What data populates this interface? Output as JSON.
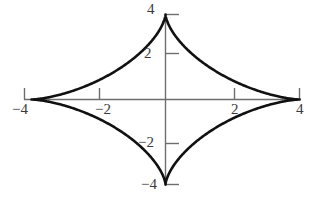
{
  "chart_data": {
    "type": "line",
    "title": "",
    "xlabel": "",
    "ylabel": "",
    "xlim": [
      -4.2,
      4.2
    ],
    "ylim": [
      -4.2,
      4.2
    ],
    "grid": false,
    "legend": null,
    "curve_name": "astroid",
    "equation": "x^(2/3) + y^(2/3) = 4^(2/3)",
    "parametric": "x = 4cos^3(t), y = 4sin^3(t)",
    "cusps": [
      {
        "x": 4,
        "y": 0
      },
      {
        "x": 0,
        "y": 4
      },
      {
        "x": -4,
        "y": 0
      },
      {
        "x": 0,
        "y": -4
      }
    ],
    "curve_color": "#111111",
    "axis_color": "#6e6e6e",
    "x_ticks": [
      -4,
      -2,
      2,
      4
    ],
    "y_ticks": [
      -4,
      -2,
      2,
      4
    ],
    "x_tick_labels": [
      "−4",
      "−2",
      "2",
      "4"
    ],
    "y_tick_labels": [
      "−4",
      "−2",
      "2",
      "4"
    ],
    "series": [
      {
        "name": "astroid",
        "x": [
          4,
          3.88,
          3.54,
          3.02,
          2.38,
          1.72,
          1.08,
          0.55,
          0.19,
          0.02,
          0,
          0.02,
          0.19,
          0.55,
          1.08,
          1.72,
          2.38,
          3.02,
          3.54,
          3.88,
          4
        ],
        "y": [
          0,
          0.02,
          0.19,
          0.55,
          1.08,
          1.72,
          2.38,
          3.02,
          3.54,
          3.88,
          4,
          3.88,
          3.54,
          3.02,
          2.38,
          1.72,
          1.08,
          0.55,
          0.19,
          0.02,
          0
        ]
      }
    ]
  },
  "labels": {
    "x_neg4": "−4",
    "x_neg2": "−2",
    "x_pos2": "2",
    "x_pos4": "4",
    "y_pos4": "4",
    "y_pos2": "2",
    "y_neg2": "−2",
    "y_neg4": "−4"
  }
}
